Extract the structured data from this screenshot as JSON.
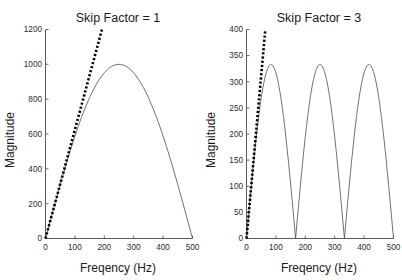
{
  "figure": {
    "background_color": "#ffffff",
    "panel_count": 2
  },
  "panels": [
    {
      "id": "skip-factor-1",
      "title": "Skip Factor = 1",
      "xlabel": "Freqency (Hz)",
      "ylabel": "Magnitude",
      "xticks": [
        "0",
        "100",
        "200",
        "300",
        "400",
        "500"
      ],
      "yticks": [
        "0",
        "200",
        "400",
        "600",
        "800",
        "1000",
        "1200"
      ]
    },
    {
      "id": "skip-factor-3",
      "title": "Skip Factor = 3",
      "xlabel": "Freqency (Hz)",
      "ylabel": "Magnitude",
      "xticks": [
        "0",
        "100",
        "200",
        "300",
        "400",
        "500"
      ],
      "yticks": [
        "0",
        "50",
        "100",
        "150",
        "200",
        "250",
        "300",
        "350",
        "400"
      ]
    }
  ],
  "chart_data": [
    {
      "type": "line",
      "id": "skip-factor-1",
      "title": "Skip Factor = 1",
      "xlabel": "Freqency (Hz)",
      "ylabel": "Magnitude",
      "xlim": [
        0,
        500
      ],
      "ylim": [
        0,
        1200
      ],
      "xticks": [
        0,
        100,
        200,
        300,
        400,
        500
      ],
      "yticks": [
        0,
        200,
        400,
        600,
        800,
        1000,
        1200
      ],
      "grid": false,
      "legend": null,
      "series": [
        {
          "name": "magnitude-response",
          "style": "solid-thin",
          "color": "#555555",
          "description": "Single arch peaking at 1000 near 250 Hz, zero at 0 and 500 Hz",
          "x": [
            0,
            25,
            50,
            75,
            100,
            125,
            150,
            175,
            200,
            225,
            250,
            275,
            300,
            325,
            350,
            375,
            400,
            425,
            450,
            475,
            500
          ],
          "y": [
            0,
            156,
            309,
            454,
            588,
            707,
            809,
            891,
            951,
            988,
            1000,
            988,
            951,
            891,
            809,
            707,
            588,
            454,
            309,
            156,
            0
          ]
        },
        {
          "name": "initial-slope-tangent",
          "style": "dotted-thick",
          "color": "#000000",
          "description": "Straight dotted line through origin with slope 6.25 magnitude per Hz, clipped at axis top",
          "slope": 6.25,
          "intercept": 0,
          "x": [
            0,
            192
          ],
          "y": [
            0,
            1200
          ]
        }
      ]
    },
    {
      "type": "line",
      "id": "skip-factor-3",
      "title": "Skip Factor = 3",
      "xlabel": "Freqency (Hz)",
      "ylabel": "Magnitude",
      "xlim": [
        0,
        500
      ],
      "ylim": [
        0,
        400
      ],
      "xticks": [
        0,
        100,
        200,
        300,
        400,
        500
      ],
      "yticks": [
        0,
        50,
        100,
        150,
        200,
        250,
        300,
        350,
        400
      ],
      "grid": false,
      "legend": null,
      "series": [
        {
          "name": "magnitude-response",
          "style": "solid-thin",
          "color": "#555555",
          "description": "Three arches each peaking at 333, zeros at 0, 167, 333 and 500 Hz",
          "x": [
            0,
            21,
            42,
            63,
            83,
            104,
            125,
            146,
            167,
            188,
            208,
            229,
            250,
            271,
            292,
            313,
            333,
            354,
            375,
            396,
            417,
            438,
            458,
            479,
            500
          ],
          "y": [
            0,
            129,
            236,
            308,
            333,
            308,
            236,
            129,
            0,
            129,
            236,
            308,
            333,
            308,
            236,
            129,
            0,
            129,
            236,
            308,
            333,
            308,
            236,
            129,
            0
          ]
        },
        {
          "name": "initial-slope-tangent",
          "style": "dotted-thick",
          "color": "#000000",
          "description": "Straight dotted line through origin with slope 6.25 magnitude per Hz, clipped at axis top",
          "slope": 6.25,
          "intercept": 0,
          "x": [
            0,
            64
          ],
          "y": [
            0,
            400
          ]
        }
      ]
    }
  ]
}
